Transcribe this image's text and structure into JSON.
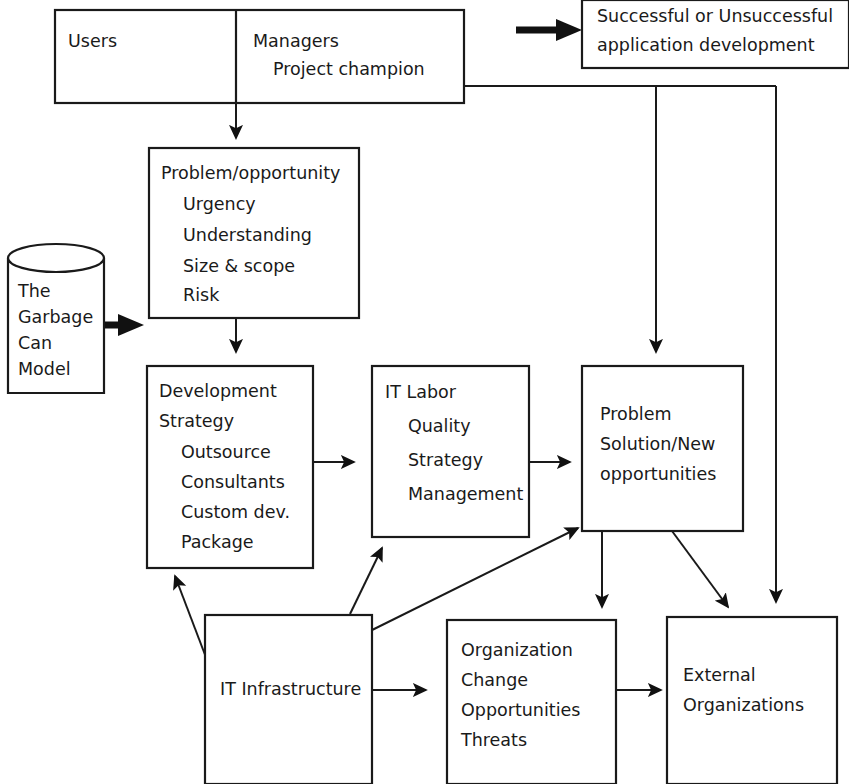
{
  "diagram": {
    "type": "flowchart",
    "nodes": {
      "users": {
        "label": "Users"
      },
      "managers": {
        "line1": "Managers",
        "line2": "Project champion"
      },
      "outcome": {
        "line1": "Successful or Unsuccessful",
        "line2": "application development"
      },
      "problem_opportunity": {
        "heading": "Problem/opportunity",
        "items": [
          "Urgency",
          "Understanding",
          "Size & scope",
          "Risk"
        ]
      },
      "garbage_can": {
        "lines": [
          "The",
          "Garbage",
          "Can",
          "Model"
        ]
      },
      "development_strategy": {
        "heading1": "Development",
        "heading2": "Strategy",
        "items": [
          "Outsource",
          "Consultants",
          "Custom dev.",
          "Package"
        ]
      },
      "it_labor": {
        "heading": "IT Labor",
        "items": [
          "Quality",
          "Strategy",
          "Management"
        ]
      },
      "problem_solution": {
        "lines": [
          "Problem",
          "Solution/New",
          "opportunities"
        ]
      },
      "it_infrastructure": {
        "label": "IT Infrastructure"
      },
      "organization": {
        "items": [
          "Organization",
          "Change",
          "Opportunities",
          "Threats"
        ]
      },
      "external_organizations": {
        "lines": [
          "External",
          "Organizations"
        ]
      }
    },
    "colors": {
      "stroke": "#1a1a1a",
      "fill": "#ffffff",
      "text": "#1a1a1a"
    }
  }
}
